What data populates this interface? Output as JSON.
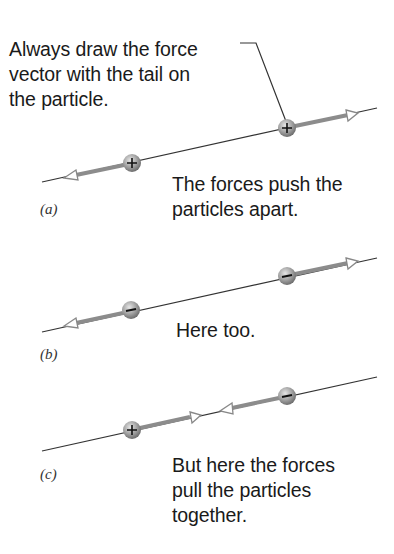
{
  "callout": {
    "text": "Always draw the force\nvector with the tail on\nthe particle."
  },
  "panels": [
    {
      "label": "(a)",
      "caption": "The forces push the\nparticles apart.",
      "charges": [
        "+",
        "+"
      ],
      "forces": "repulsive"
    },
    {
      "label": "(b)",
      "caption": "Here too.",
      "charges": [
        "−",
        "−"
      ],
      "forces": "repulsive"
    },
    {
      "label": "(c)",
      "caption": "But here the forces\npull the particles\ntogether.",
      "charges": [
        "+",
        "−"
      ],
      "forces": "attractive"
    }
  ],
  "colors": {
    "line": "#333333",
    "vector": "#8c8c8c",
    "particle": "#9a9a9a",
    "text": "#1a1a1a"
  }
}
